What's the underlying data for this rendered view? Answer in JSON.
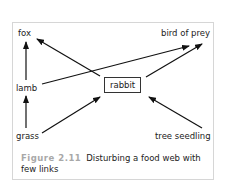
{
  "diagram": {
    "type": "food-web",
    "nodes": [
      {
        "id": "fox",
        "label": "fox"
      },
      {
        "id": "bird_of_prey",
        "label": "bird of prey"
      },
      {
        "id": "lamb",
        "label": "lamb"
      },
      {
        "id": "rabbit",
        "label": "rabbit",
        "boxed": true
      },
      {
        "id": "grass",
        "label": "grass"
      },
      {
        "id": "tree_seedling",
        "label": "tree seedling"
      }
    ],
    "edges": [
      {
        "from": "lamb",
        "to": "fox"
      },
      {
        "from": "lamb",
        "to": "bird_of_prey"
      },
      {
        "from": "rabbit",
        "to": "fox"
      },
      {
        "from": "rabbit",
        "to": "bird_of_prey"
      },
      {
        "from": "grass",
        "to": "lamb"
      },
      {
        "from": "grass",
        "to": "rabbit"
      },
      {
        "from": "tree_seedling",
        "to": "rabbit"
      }
    ]
  },
  "labels": {
    "fox": "fox",
    "bird_of_prey": "bird of prey",
    "lamb": "lamb",
    "rabbit": "rabbit",
    "grass": "grass",
    "tree_seedling": "tree seedling"
  },
  "caption": {
    "figure_number": "Figure 2.11",
    "text": "Disturbing a food web with few links"
  },
  "colors": {
    "arrow": "#111111",
    "frame_border": "#d6d6d6",
    "figure_label": "#a8a8a8",
    "text": "#222222"
  }
}
